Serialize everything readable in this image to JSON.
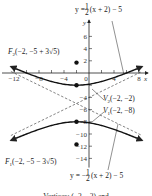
{
  "chart_data": {
    "type": "line",
    "title": "",
    "xlabel": "x",
    "ylabel": "y",
    "xlim": [
      -13.5,
      9.5
    ],
    "ylim": [
      -15.5,
      8.5
    ],
    "x_ticks": [
      -12,
      -8,
      -4,
      4,
      8
    ],
    "x_tick_labels": [
      "−12",
      "−8",
      "−4",
      "4",
      "8"
    ],
    "x_minor_step": 2,
    "origin_label": "0",
    "y_ticks": [
      6,
      4,
      2,
      -4,
      -6,
      -8,
      -10,
      -12,
      -14
    ],
    "y_tick_labels": [
      "6",
      "4",
      "2",
      "−4",
      "−6",
      "−8",
      "−10",
      "−12",
      "−14"
    ],
    "hyperbola": {
      "center": [
        -2,
        -5
      ],
      "a": 3,
      "b": 6,
      "orientation": "vertical",
      "equation": "(y+5)^2/9 - (x+2)^2/36 = 1",
      "x_range": [
        -12.5,
        8.5
      ]
    },
    "asymptotes": [
      {
        "slope": 0.5,
        "intercept_form": "y = (1/2)(x + 2) − 5",
        "style": "dashed"
      },
      {
        "slope": -0.5,
        "intercept_form": "y = −(1/2)(x + 2) − 5",
        "style": "dashed"
      }
    ],
    "points": [
      {
        "name": "F2",
        "x": -2,
        "y": 1.708
      },
      {
        "name": "V2",
        "x": -2,
        "y": -2
      },
      {
        "name": "V1",
        "x": -2,
        "y": -8
      },
      {
        "name": "F1",
        "x": -2,
        "y": -11.708
      }
    ],
    "annotations": {
      "asym_top": {
        "prefix": "y = ",
        "frac_num": "1",
        "frac_den": "2",
        "suffix": "(x + 2) − 5"
      },
      "asym_bottom": {
        "prefix": "y = −",
        "frac_num": "1",
        "frac_den": "2",
        "suffix": "(x + 2) − 5"
      },
      "f2": {
        "letter": "F",
        "sub": "2",
        "text": "(−2, −5 + 3√5)"
      },
      "v2": {
        "letter": "V",
        "sub": "2",
        "text": "(−2, −2)"
      },
      "v1": {
        "letter": "V",
        "sub": "1",
        "text": "(−2, −8)"
      },
      "f1": {
        "letter": "F",
        "sub": "1",
        "text": "(−2, −5 − 3√5)"
      }
    },
    "caption": "Vertices: (−2, −2) and"
  }
}
